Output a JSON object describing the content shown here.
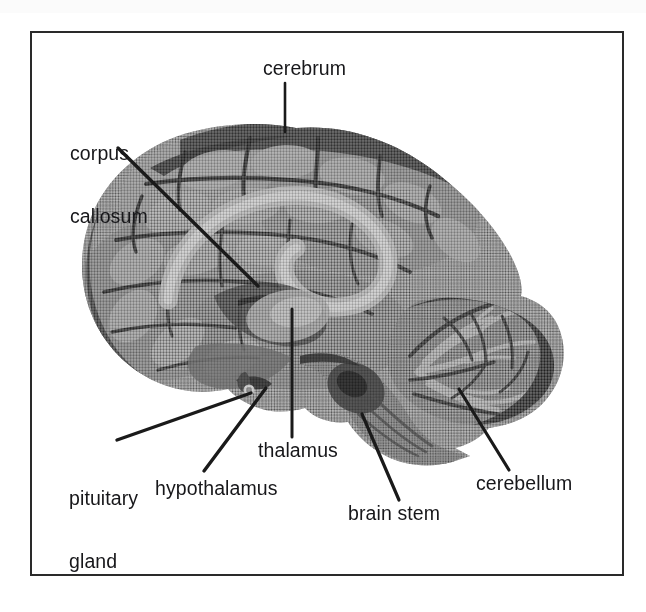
{
  "figure": {
    "type": "anatomical-illustration",
    "background_color": "#ffffff",
    "frame_color": "#2a2a2a",
    "label_color": "#17171a",
    "leader_line_color": "#1a1a1a",
    "scan_bar_color": "#fbfbfb"
  },
  "labels": {
    "cerebrum": "cerebrum",
    "corpus_callosum_line1": "corpus",
    "corpus_callosum_line2": "callosum",
    "pituitary_line1": "pituitary",
    "pituitary_line2": "gland",
    "hypothalamus": "hypothalamus",
    "thalamus": "thalamus",
    "brain_stem": "brain stem",
    "cerebellum": "cerebellum"
  },
  "callouts": [
    {
      "name": "cerebrum",
      "text_anchor": [
        285,
        82
      ],
      "target": [
        285,
        131
      ]
    },
    {
      "name": "corpus-callosum",
      "text_anchor": [
        118,
        148
      ],
      "target": [
        258,
        286
      ]
    },
    {
      "name": "pituitary-gland",
      "text_anchor": [
        117,
        440
      ],
      "target": [
        251,
        394
      ]
    },
    {
      "name": "hypothalamus",
      "text_anchor": [
        204,
        471
      ],
      "target": [
        266,
        389
      ]
    },
    {
      "name": "thalamus",
      "text_anchor": [
        292,
        437
      ],
      "target": [
        292,
        309
      ]
    },
    {
      "name": "brain-stem",
      "text_anchor": [
        399,
        500
      ],
      "target": [
        362,
        414
      ]
    },
    {
      "name": "cerebellum",
      "text_anchor": [
        509,
        470
      ],
      "target": [
        459,
        389
      ]
    }
  ]
}
